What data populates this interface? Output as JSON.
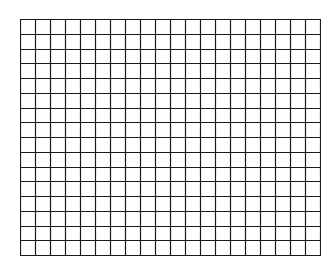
{
  "grid": {
    "columns": 20,
    "rows": 16,
    "line_color": "#1a1a1a",
    "background": "#ffffff",
    "left": 20,
    "top": 19,
    "width": 301,
    "height": 237
  }
}
